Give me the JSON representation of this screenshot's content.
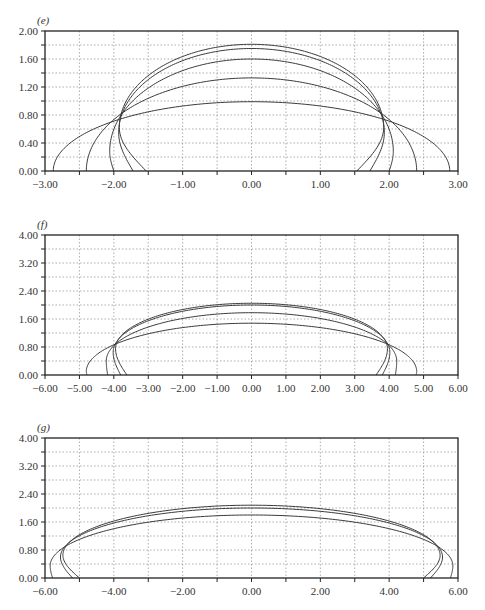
{
  "chart_data": [
    {
      "panel": "e",
      "type": "line",
      "title": "(e)",
      "xlabel": "",
      "ylabel": "",
      "xlim": [
        -3.0,
        3.0
      ],
      "ylim": [
        0.0,
        2.0
      ],
      "xticks": [
        "-3.00",
        "-2.00",
        "-1.00",
        "0.00",
        "1.00",
        "2.00",
        "3.00"
      ],
      "xtick_values": [
        -3,
        -2,
        -1,
        0,
        1,
        2,
        3
      ],
      "xgrid_step": 0.5,
      "yticks": [
        "0.00",
        "0.40",
        "0.80",
        "1.20",
        "1.60",
        "2.00"
      ],
      "ytick_values": [
        0,
        0.4,
        0.8,
        1.2,
        1.6,
        2.0
      ],
      "ygrid_step": 0.2,
      "grid": true,
      "series": [
        {
          "name": "curve-1",
          "base_x": 2.88,
          "max_half_width": 2.88,
          "bulge_y": 0.0,
          "apex_y": 0.99
        },
        {
          "name": "curve-2",
          "base_x": 2.4,
          "max_half_width": 2.4,
          "bulge_y": 0.0,
          "apex_y": 1.33
        },
        {
          "name": "curve-3",
          "base_x": 2.0,
          "max_half_width": 2.06,
          "bulge_y": 0.28,
          "apex_y": 1.6
        },
        {
          "name": "curve-4",
          "base_x": 1.72,
          "max_half_width": 1.93,
          "bulge_y": 0.55,
          "apex_y": 1.75
        },
        {
          "name": "curve-5",
          "base_x": 1.53,
          "max_half_width": 1.92,
          "bulge_y": 0.62,
          "apex_y": 1.81
        }
      ]
    },
    {
      "panel": "f",
      "type": "line",
      "title": "(f)",
      "xlabel": "",
      "ylabel": "",
      "xlim": [
        -6.0,
        6.0
      ],
      "ylim": [
        0.0,
        4.0
      ],
      "xticks": [
        "-6.00",
        "-5.00",
        "-4.00",
        "-3.00",
        "-2.00",
        "-1.00",
        "0.00",
        "1.00",
        "2.00",
        "3.00",
        "4.00",
        "5.00",
        "6.00"
      ],
      "xtick_values": [
        -6,
        -5,
        -4,
        -3,
        -2,
        -1,
        0,
        1,
        2,
        3,
        4,
        5,
        6
      ],
      "xgrid_step": 1.0,
      "yticks": [
        "0.00",
        "0.80",
        "1.60",
        "2.40",
        "3.20",
        "4.00"
      ],
      "ytick_values": [
        0,
        0.8,
        1.6,
        2.4,
        3.2,
        4.0
      ],
      "ygrid_step": 0.4,
      "grid": true,
      "series": [
        {
          "name": "curve-1",
          "base_x": 4.78,
          "max_half_width": 4.8,
          "bulge_y": 0.1,
          "apex_y": 1.48
        },
        {
          "name": "curve-2",
          "base_x": 4.18,
          "max_half_width": 4.22,
          "bulge_y": 0.4,
          "apex_y": 1.78
        },
        {
          "name": "curve-3",
          "base_x": 3.8,
          "max_half_width": 4.02,
          "bulge_y": 0.65,
          "apex_y": 2.0
        },
        {
          "name": "curve-4",
          "base_x": 3.62,
          "max_half_width": 3.95,
          "bulge_y": 0.75,
          "apex_y": 2.05
        }
      ]
    },
    {
      "panel": "g",
      "type": "line",
      "title": "(g)",
      "xlabel": "",
      "ylabel": "",
      "xlim": [
        -6.0,
        6.0
      ],
      "ylim": [
        0.0,
        4.0
      ],
      "xticks": [
        "-6.00",
        "-4.00",
        "-2.00",
        "0.00",
        "2.00",
        "4.00",
        "6.00"
      ],
      "xtick_values": [
        -6,
        -4,
        -2,
        0,
        2,
        4,
        6
      ],
      "xgrid_step": 1.0,
      "yticks": [
        "0.00",
        "0.80",
        "1.60",
        "2.40",
        "3.20",
        "4.00"
      ],
      "ytick_values": [
        0,
        0.8,
        1.6,
        2.4,
        3.2,
        4.0
      ],
      "ygrid_step": 0.4,
      "grid": true,
      "series": [
        {
          "name": "curve-1",
          "base_x": 5.78,
          "max_half_width": 5.85,
          "bulge_y": 0.35,
          "apex_y": 1.8
        },
        {
          "name": "curve-2",
          "base_x": 5.2,
          "max_half_width": 5.55,
          "bulge_y": 0.6,
          "apex_y": 2.0
        },
        {
          "name": "curve-3",
          "base_x": 5.0,
          "max_half_width": 5.48,
          "bulge_y": 0.65,
          "apex_y": 2.08
        }
      ]
    }
  ],
  "panels": [
    {
      "label": "(e)"
    },
    {
      "label": "(f)"
    },
    {
      "label": "(g)"
    }
  ],
  "colors": {
    "curve": "#3a3a3a",
    "frame": "#222222",
    "grid": "#8a8a8a",
    "text": "#333333"
  }
}
